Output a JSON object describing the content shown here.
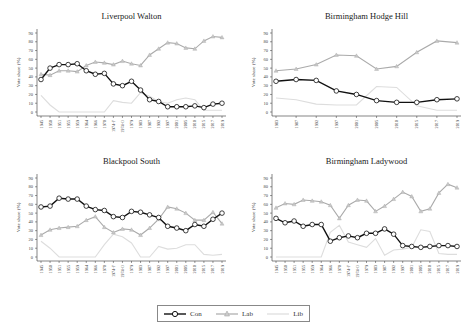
{
  "chart_data": [
    {
      "type": "line",
      "title": "Liverpool Walton",
      "xlabel": "",
      "ylabel": "Vote share (%)",
      "ylim": [
        0,
        90
      ],
      "yticks": [
        0,
        10,
        20,
        30,
        40,
        50,
        60,
        70,
        80,
        90
      ],
      "x": [
        "1945",
        "1950",
        "1951",
        "1955",
        "1959",
        "1964",
        "1966",
        "1970",
        "1974-F",
        "1974-O",
        "1979",
        "1983",
        "1987",
        "1992",
        "1997",
        "2001",
        "2005",
        "2010",
        "2015",
        "2017",
        "2019"
      ],
      "series": [
        {
          "name": "Con",
          "values": [
            37,
            50,
            54,
            54,
            55,
            47,
            43,
            44,
            32,
            30,
            35,
            25,
            14,
            12,
            6,
            6,
            6,
            7,
            5,
            9,
            10
          ]
        },
        {
          "name": "Lab",
          "values": [
            43,
            42,
            47,
            47,
            46,
            53,
            57,
            56,
            54,
            58,
            55,
            53,
            65,
            72,
            79,
            78,
            73,
            72,
            81,
            86,
            85
          ]
        },
        {
          "name": "Lib",
          "values": [
            19,
            8,
            0,
            0,
            0,
            0,
            0,
            0,
            13,
            11,
            10,
            22,
            18,
            12,
            10,
            14,
            16,
            14,
            2,
            2,
            2
          ]
        }
      ]
    },
    {
      "type": "line",
      "title": "Birmingham Hodge Hill",
      "xlabel": "",
      "ylabel": "Vote share (%)",
      "ylim": [
        0,
        90
      ],
      "yticks": [
        0,
        10,
        20,
        30,
        40,
        50,
        60,
        70,
        80,
        90
      ],
      "x": [
        "1983",
        "1987",
        "1992",
        "1997",
        "2001",
        "2005",
        "2010",
        "2015",
        "2017",
        "2019"
      ],
      "series": [
        {
          "name": "Con",
          "values": [
            35,
            37,
            36,
            24,
            20,
            13,
            11,
            11,
            14,
            15
          ]
        },
        {
          "name": "Lab",
          "values": [
            47,
            49,
            54,
            65,
            64,
            49,
            52,
            68,
            81,
            79
          ]
        },
        {
          "name": "Lib",
          "values": [
            16,
            14,
            9,
            8,
            8,
            29,
            28,
            7,
            2,
            2
          ]
        }
      ]
    },
    {
      "type": "line",
      "title": "Blackpool South",
      "xlabel": "",
      "ylabel": "Vote share (%)",
      "ylim": [
        0,
        90
      ],
      "yticks": [
        0,
        10,
        20,
        30,
        40,
        50,
        60,
        70,
        80,
        90
      ],
      "x": [
        "1945",
        "1950",
        "1951",
        "1955",
        "1959",
        "1964",
        "1966",
        "1970",
        "1974-F",
        "1974-O",
        "1979",
        "1983",
        "1987",
        "1992",
        "1997",
        "2001",
        "2005",
        "2010",
        "2015",
        "2017",
        "2019"
      ],
      "series": [
        {
          "name": "Con",
          "values": [
            57,
            58,
            67,
            66,
            66,
            58,
            54,
            53,
            46,
            45,
            52,
            51,
            48,
            45,
            35,
            33,
            30,
            37,
            35,
            43,
            50
          ]
        },
        {
          "name": "Lab",
          "values": [
            25,
            31,
            33,
            34,
            35,
            42,
            46,
            34,
            28,
            32,
            31,
            25,
            33,
            43,
            57,
            55,
            50,
            42,
            42,
            51,
            38
          ]
        },
        {
          "name": "Lib",
          "values": [
            18,
            10,
            0,
            0,
            0,
            0,
            0,
            14,
            26,
            23,
            16,
            0,
            0,
            12,
            9,
            10,
            14,
            14,
            3,
            2,
            3
          ]
        }
      ]
    },
    {
      "type": "line",
      "title": "Birmingham Ladywood",
      "xlabel": "",
      "ylabel": "Vote share (%)",
      "ylim": [
        0,
        90
      ],
      "yticks": [
        0,
        10,
        20,
        30,
        40,
        50,
        60,
        70,
        80,
        90
      ],
      "x": [
        "1945",
        "1950",
        "1951",
        "1955",
        "1959",
        "1964",
        "1966",
        "1970",
        "1974-F",
        "1974-O",
        "1979",
        "1983",
        "1987",
        "1992",
        "1997",
        "2001",
        "2005",
        "2010",
        "2015",
        "2017",
        "2019"
      ],
      "series": [
        {
          "name": "Con",
          "values": [
            44,
            39,
            41,
            35,
            37,
            37,
            18,
            22,
            24,
            22,
            27,
            27,
            32,
            26,
            13,
            12,
            11,
            12,
            13,
            13,
            12
          ]
        },
        {
          "name": "Lab",
          "values": [
            56,
            61,
            60,
            65,
            64,
            63,
            59,
            44,
            59,
            65,
            64,
            52,
            58,
            66,
            74,
            69,
            52,
            55,
            73,
            83,
            79
          ]
        },
        {
          "name": "Lib",
          "values": [
            0,
            0,
            0,
            0,
            0,
            0,
            28,
            36,
            17,
            14,
            11,
            21,
            2,
            8,
            9,
            11,
            31,
            29,
            4,
            3,
            3
          ]
        }
      ]
    }
  ],
  "legend": {
    "items": [
      {
        "label": "Con",
        "color": "#111111",
        "marker": "circle"
      },
      {
        "label": "Lab",
        "color": "#aaaaaa",
        "marker": "triangle"
      },
      {
        "label": "Lib",
        "color": "#dddddd",
        "marker": "none"
      }
    ]
  },
  "colors": {
    "con": "#111111",
    "lab": "#aaaaaa",
    "lib": "#dddddd",
    "axis": "#333333"
  }
}
